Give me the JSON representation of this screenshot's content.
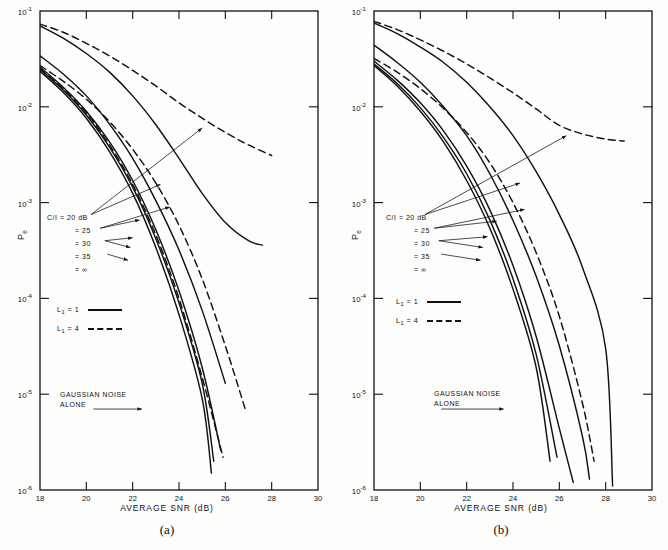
{
  "figure": {
    "panels": [
      {
        "caption": "(a)",
        "xlabel": "AVERAGE SNR (dB)",
        "ylabel": "P",
        "ylabel_sub": "e",
        "xticks": [
          "18",
          "20",
          "22",
          "24",
          "26",
          "28",
          "30"
        ],
        "yticks": [
          "10",
          "10",
          "10",
          "10",
          "10",
          "10"
        ],
        "yexps": [
          "-1",
          "-2",
          "-3",
          "-4",
          "-5",
          "-6"
        ],
        "ci_title": "C/I = 20 dB",
        "ci_items": [
          "= 25",
          "= 30",
          "= 35",
          "= ∞"
        ],
        "legend": [
          {
            "label": "L",
            "sub": "1",
            "value": "= 1",
            "style": "solid"
          },
          {
            "label": "L",
            "sub": "1",
            "value": "= 4",
            "style": "dashed"
          }
        ],
        "note_line1": "GAUSSIAN NOISE",
        "note_line2": "ALONE"
      },
      {
        "caption": "(b)",
        "xlabel": "AVERAGE SNR (dB)",
        "ylabel": "P",
        "ylabel_sub": "e",
        "xticks": [
          "18",
          "20",
          "22",
          "24",
          "26",
          "28",
          "30"
        ],
        "yticks": [
          "10",
          "10",
          "10",
          "10",
          "10",
          "10"
        ],
        "yexps": [
          "-1",
          "-2",
          "-3",
          "-4",
          "-5",
          "-6"
        ],
        "ci_title": "C/I = 20 dB",
        "ci_items": [
          "= 25",
          "= 30",
          "= 35",
          "= ∞"
        ],
        "legend": [
          {
            "label": "L",
            "sub": "1",
            "value": "= 1",
            "style": "solid"
          },
          {
            "label": "L",
            "sub": "1",
            "value": "= 4",
            "style": "dashed"
          }
        ],
        "note_line1": "GAUSSIAN NOISE",
        "note_line2": "ALONE"
      }
    ]
  },
  "chart_data": [
    {
      "type": "line",
      "panel": "(a)",
      "title": "",
      "xlabel": "AVERAGE SNR (dB)",
      "ylabel": "Pe",
      "xlim": [
        18,
        30
      ],
      "ylim": [
        1e-06,
        0.1
      ],
      "yscale": "log",
      "grid": false,
      "legend_position": "inside-left",
      "legend_entries": [
        "L1 = 1 (solid)",
        "L1 = 4 (dashed)"
      ],
      "annotations": [
        "C/I = 20 dB",
        "= 25",
        "= 30",
        "= 35",
        "= ∞",
        "GAUSSIAN NOISE ALONE"
      ],
      "series": [
        {
          "name": "L1=1, C/I=20 dB",
          "style": "solid",
          "x": [
            18,
            19,
            20,
            21,
            22,
            23,
            24,
            25,
            26,
            27,
            27.6
          ],
          "y": [
            0.07,
            0.052,
            0.036,
            0.023,
            0.013,
            0.0065,
            0.0029,
            0.00125,
            0.00062,
            0.0004,
            0.00036
          ]
        },
        {
          "name": "L1=4, C/I=20 dB",
          "style": "dashed",
          "x": [
            18,
            19,
            20,
            21,
            22,
            23,
            24,
            25,
            26,
            27,
            28
          ],
          "y": [
            0.073,
            0.06,
            0.046,
            0.034,
            0.024,
            0.0165,
            0.011,
            0.0076,
            0.0054,
            0.004,
            0.0031
          ]
        },
        {
          "name": "L1=25 family solid",
          "style": "solid",
          "x": [
            18,
            19,
            20,
            21,
            22,
            23,
            24,
            25,
            26
          ],
          "y": [
            0.034,
            0.022,
            0.013,
            0.0066,
            0.0029,
            0.00105,
            0.00032,
            7.5e-05,
            1.3e-05
          ]
        },
        {
          "name": "L1=4, C/I=25 dB",
          "style": "dashed",
          "x": [
            18,
            19,
            20,
            21,
            22,
            23,
            24,
            25,
            26,
            26.9
          ],
          "y": [
            0.027,
            0.0185,
            0.012,
            0.007,
            0.0036,
            0.0016,
            0.00058,
            0.00016,
            3.2e-05,
            6.5e-06
          ]
        },
        {
          "name": "C/I=30 dB solid",
          "style": "solid",
          "x": [
            18,
            19,
            20,
            21,
            22,
            23,
            24,
            25,
            25.8
          ],
          "y": [
            0.026,
            0.016,
            0.009,
            0.0043,
            0.0017,
            0.00052,
            0.00012,
            1.9e-05,
            2.6e-06
          ]
        },
        {
          "name": "C/I=35 dB solid",
          "style": "solid",
          "x": [
            18,
            19,
            20,
            21,
            22,
            23,
            24,
            25,
            25.5
          ],
          "y": [
            0.0245,
            0.015,
            0.0082,
            0.0038,
            0.00145,
            0.00042,
            9e-05,
            1.3e-05,
            2e-06
          ]
        },
        {
          "name": "C/I=inf solid (Gaussian noise alone)",
          "style": "solid",
          "x": [
            18,
            19,
            20,
            21,
            22,
            23,
            24,
            25,
            25.4
          ],
          "y": [
            0.0235,
            0.0142,
            0.0076,
            0.0034,
            0.00125,
            0.00034,
            6.8e-05,
            9e-06,
            1.5e-06
          ]
        },
        {
          "name": "C/I=inf dashed",
          "style": "dashed",
          "x": [
            18,
            19,
            20,
            21,
            22,
            23,
            24,
            25,
            25.9
          ],
          "y": [
            0.025,
            0.0155,
            0.0086,
            0.004,
            0.00155,
            0.00046,
            0.0001,
            1.5e-05,
            2.2e-06
          ]
        }
      ]
    },
    {
      "type": "line",
      "panel": "(b)",
      "title": "",
      "xlabel": "AVERAGE SNR (dB)",
      "ylabel": "Pe",
      "xlim": [
        18,
        30
      ],
      "ylim": [
        1e-06,
        0.1
      ],
      "yscale": "log",
      "grid": false,
      "legend_position": "inside-left",
      "legend_entries": [
        "L1 = 1 (solid)",
        "L1 = 4 (dashed)"
      ],
      "annotations": [
        "C/I = 20 dB",
        "= 25",
        "= 30",
        "= 35",
        "= ∞",
        "GAUSSIAN NOISE ALONE"
      ],
      "series": [
        {
          "name": "L1=1, C/I=20 dB",
          "style": "solid",
          "x": [
            18,
            19,
            20,
            21,
            22,
            23,
            24,
            25,
            26,
            27,
            28,
            28.3
          ],
          "y": [
            0.075,
            0.058,
            0.042,
            0.029,
            0.018,
            0.01,
            0.005,
            0.0021,
            0.00075,
            0.00021,
            3e-05,
            1.1e-06
          ]
        },
        {
          "name": "L1=4, C/I=20 dB",
          "style": "dashed",
          "x": [
            18,
            19,
            20,
            21,
            22,
            23,
            24,
            25,
            26,
            27,
            28,
            28.8
          ],
          "y": [
            0.078,
            0.064,
            0.05,
            0.038,
            0.028,
            0.02,
            0.014,
            0.0095,
            0.0064,
            0.0052,
            0.0046,
            0.0044
          ]
        },
        {
          "name": "C/I=25 dB solid",
          "style": "solid",
          "x": [
            18,
            19,
            20,
            21,
            22,
            23,
            24,
            25,
            26,
            27,
            27.3
          ],
          "y": [
            0.044,
            0.029,
            0.018,
            0.01,
            0.005,
            0.002,
            0.00065,
            0.00017,
            3.2e-05,
            3.6e-06,
            1.3e-06
          ]
        },
        {
          "name": "L1=4, C/I=25 dB",
          "style": "dashed",
          "x": [
            18,
            19,
            20,
            21,
            22,
            23,
            24,
            25,
            26,
            27,
            27.5
          ],
          "y": [
            0.032,
            0.023,
            0.0155,
            0.0096,
            0.0054,
            0.0026,
            0.001,
            0.0003,
            6.5e-05,
            8e-06,
            2e-06
          ]
        },
        {
          "name": "C/I=30 dB solid",
          "style": "solid",
          "x": [
            18,
            19,
            20,
            21,
            22,
            23,
            24,
            25,
            26,
            26.6
          ],
          "y": [
            0.03,
            0.019,
            0.011,
            0.0056,
            0.0024,
            0.00084,
            0.00022,
            4e-05,
            4.4e-06,
            1.2e-06
          ]
        },
        {
          "name": "C/I=35 dB solid",
          "style": "solid",
          "x": [
            18,
            19,
            20,
            21,
            22,
            23,
            24,
            25,
            25.9
          ],
          "y": [
            0.028,
            0.0175,
            0.0098,
            0.0048,
            0.002,
            0.00066,
            0.00016,
            2.6e-05,
            2.2e-06
          ]
        },
        {
          "name": "C/I=inf solid (Gaussian noise alone)",
          "style": "solid",
          "x": [
            18,
            19,
            20,
            21,
            22,
            23,
            24,
            25,
            25.6
          ],
          "y": [
            0.027,
            0.0165,
            0.009,
            0.0043,
            0.0017,
            0.00054,
            0.000125,
            1.9e-05,
            2e-06
          ]
        }
      ]
    }
  ]
}
